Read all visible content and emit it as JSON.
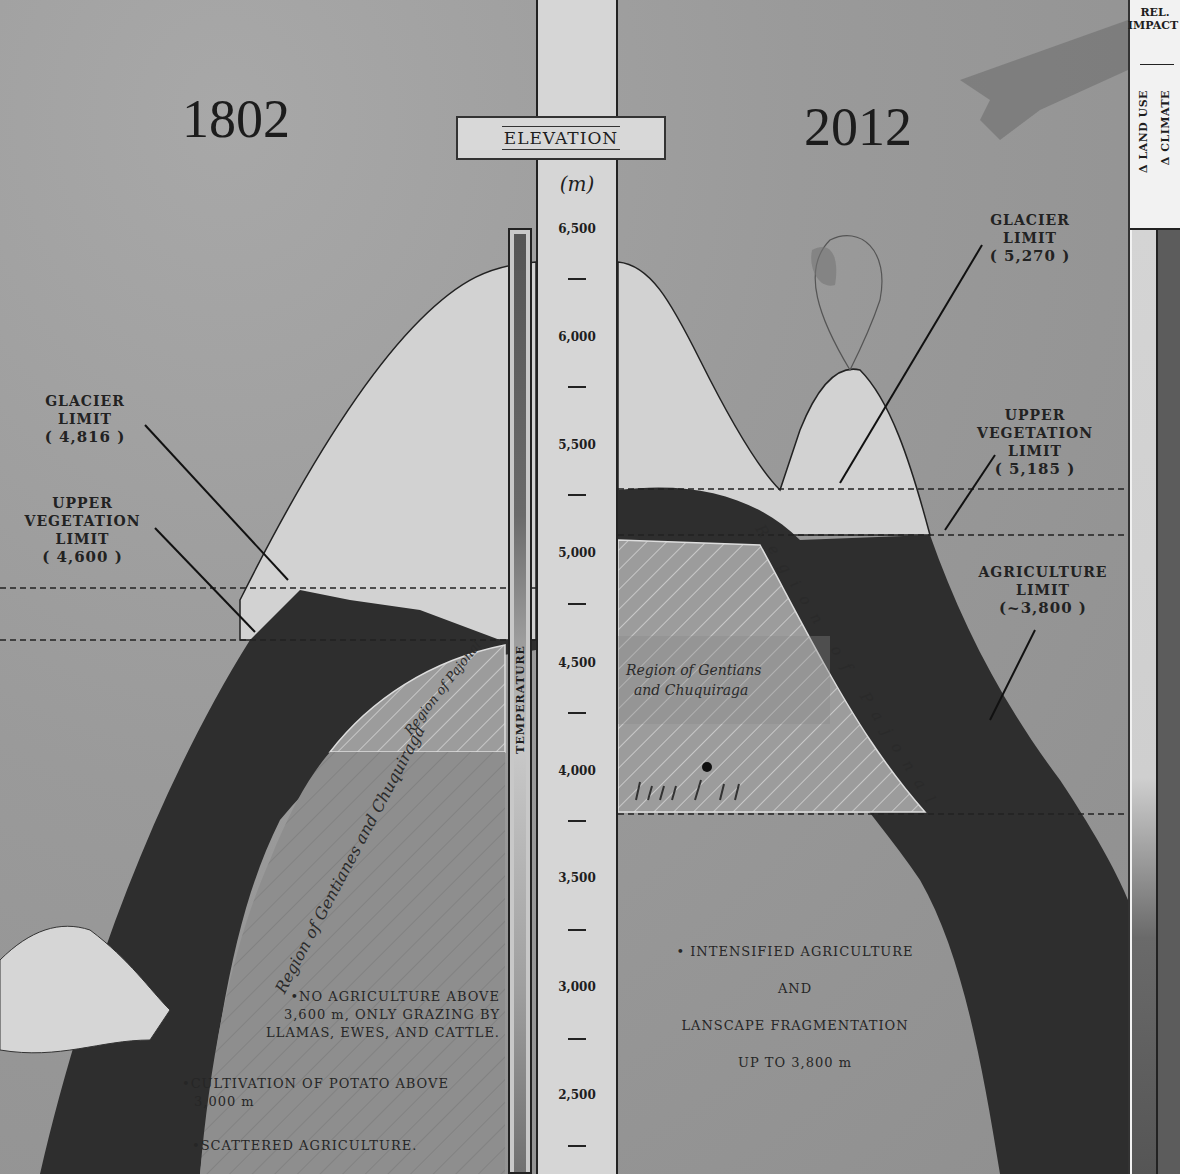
{
  "header": {
    "year_left": "1802",
    "year_right": "2012"
  },
  "axis": {
    "title": "ELEVATION",
    "unit": "(m)",
    "temperature_label": "TEMPERATURE",
    "ticks": [
      "6,500",
      "6,000",
      "5,500",
      "5,000",
      "4,500",
      "4,000",
      "3,500",
      "3,000",
      "2,500"
    ]
  },
  "left_1802": {
    "glacier_limit": {
      "title_line1": "GLACIER",
      "title_line2": "LIMIT",
      "value": "( 4,816 )"
    },
    "vegetation_limit": {
      "title_line1": "UPPER",
      "title_line2": "VEGETATION",
      "title_line3": "LIMIT",
      "value": "( 4,600 )"
    },
    "region_pajonal": "Region of Pajonal",
    "region_gentians": "Region of Gentianes and Chuquiraga",
    "notes": [
      "•NO AGRICULTURE ABOVE",
      "3,600 m, ONLY GRAZING  BY",
      "LLAMAS, EWES, AND CATTLE.",
      "•CULTIVATION OF POTATO ABOVE",
      "3,000 m",
      "•SCATTERED AGRICULTURE."
    ]
  },
  "right_2012": {
    "glacier_limit": {
      "title_line1": "GLACIER",
      "title_line2": "LIMIT",
      "value": "( 5,270 )"
    },
    "vegetation_limit": {
      "title_line1": "UPPER",
      "title_line2": "VEGETATION",
      "title_line3": "LIMIT",
      "value": "( 5,185 )"
    },
    "agriculture_limit": {
      "title_line1": "AGRICULTURE",
      "title_line2": "LIMIT",
      "value": "(~3,800 )"
    },
    "region_pajonal": "Region of Pajonal",
    "region_gentians_line1": "Region of Gentians",
    "region_gentians_line2": "and Chuquiraga",
    "notes": [
      "• INTENSIFIED AGRICULTURE",
      "AND",
      "LANSCAPE FRAGMENTATION",
      "UP TO 3,800 m"
    ]
  },
  "impact_legend": {
    "title_line1": "REL.",
    "title_line2": "IMPACT",
    "col_land": "Δ LAND USE",
    "col_climate": "Δ CLIMATE"
  },
  "colors": {
    "background": "#9a9a9a",
    "snow": "#d4d4d4",
    "forest": "#2e2e2e",
    "axis": "#d6d6d6",
    "ink": "#1e1e1e"
  }
}
